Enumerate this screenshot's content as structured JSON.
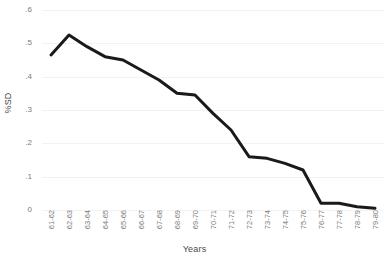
{
  "chart_data": {
    "type": "line",
    "title": "",
    "xlabel": "Years",
    "ylabel": "%SD",
    "grid": true,
    "legend": "none",
    "ylim": [
      0,
      0.6
    ],
    "y_ticks": [
      0,
      0.1,
      0.2,
      0.3,
      0.4,
      0.5,
      0.6
    ],
    "y_tick_labels": [
      "0",
      ".1",
      ".2",
      ".3",
      ".4",
      ".5",
      ".6"
    ],
    "categories": [
      "61-62",
      "62-63",
      "63-64",
      "64-65",
      "65-66",
      "66-67",
      "67-68",
      "68-69",
      "69-70",
      "70-71",
      "71-72",
      "72-73",
      "73-74",
      "74-75",
      "75-76",
      "76-77",
      "77-78",
      "78-79",
      "79-80"
    ],
    "series": [
      {
        "name": "%SD",
        "color": "#1a1a1a",
        "values": [
          0.465,
          0.525,
          0.49,
          0.46,
          0.45,
          0.42,
          0.39,
          0.35,
          0.345,
          0.29,
          0.24,
          0.16,
          0.155,
          0.14,
          0.12,
          0.02,
          0.02,
          0.01,
          0.005
        ]
      }
    ]
  },
  "style": {
    "line_color": "#1a1a1a",
    "grid_color": "#f2f2f2",
    "tick_label_color": "#7a7a7a",
    "axis_title_color": "#4a4a4a",
    "background": "#ffffff"
  }
}
